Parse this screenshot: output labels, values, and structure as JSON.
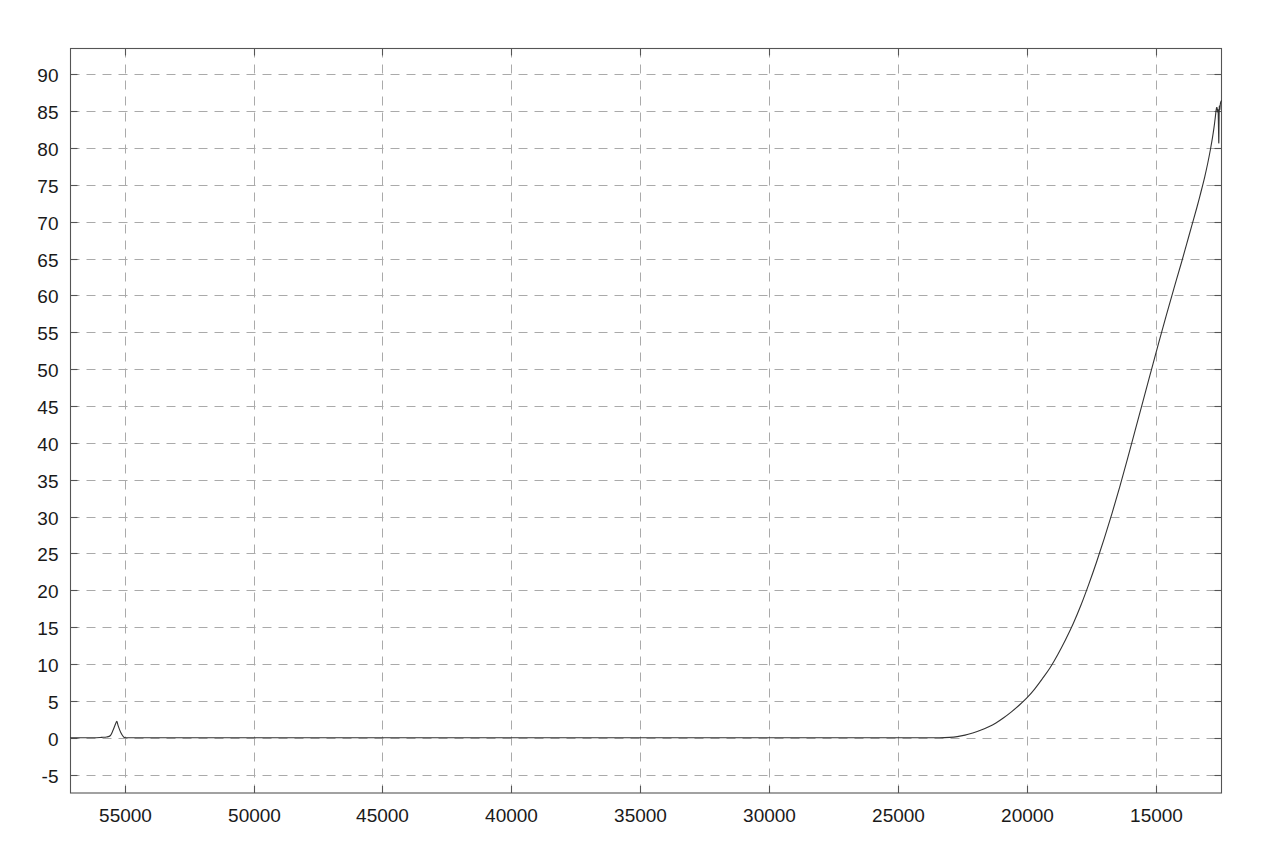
{
  "chart_data": {
    "type": "line",
    "title": "",
    "subtitle": "",
    "xlabel": "",
    "ylabel": "",
    "xlim": [
      57100,
      12450
    ],
    "ylim": [
      -7.5,
      93.5
    ],
    "x_axis_reversed": true,
    "grid": true,
    "grid_style": "dashed",
    "legend": "none",
    "xticks": [
      55000,
      50000,
      45000,
      40000,
      35000,
      30000,
      25000,
      20000,
      15000
    ],
    "xtick_labels": [
      "55000",
      "50000",
      "45000",
      "40000",
      "35000",
      "30000",
      "25000",
      "20000",
      "15000"
    ],
    "yticks": [
      -5,
      0,
      5,
      10,
      15,
      20,
      25,
      30,
      35,
      40,
      45,
      50,
      55,
      60,
      65,
      70,
      75,
      80,
      85,
      90
    ],
    "ytick_labels": [
      "-5",
      "0",
      "5",
      "10",
      "15",
      "20",
      "25",
      "30",
      "35",
      "40",
      "45",
      "50",
      "55",
      "60",
      "65",
      "70",
      "75",
      "80",
      "85",
      "90"
    ],
    "series": [
      {
        "name": "spectrum",
        "color": "#333333",
        "line_width": 1.1,
        "points": [
          [
            57100,
            0.0
          ],
          [
            56600,
            0.0
          ],
          [
            56200,
            0.0
          ],
          [
            55900,
            0.05
          ],
          [
            55700,
            0.1
          ],
          [
            55550,
            0.3
          ],
          [
            55450,
            1.0
          ],
          [
            55350,
            1.9
          ],
          [
            55300,
            2.2
          ],
          [
            55250,
            1.6
          ],
          [
            55150,
            0.7
          ],
          [
            55050,
            0.15
          ],
          [
            54950,
            0.0
          ],
          [
            54500,
            0.0
          ],
          [
            53500,
            0.0
          ],
          [
            52000,
            0.0
          ],
          [
            50000,
            0.0
          ],
          [
            48000,
            0.0
          ],
          [
            46000,
            0.0
          ],
          [
            44000,
            0.0
          ],
          [
            42000,
            0.0
          ],
          [
            40000,
            0.0
          ],
          [
            38000,
            0.0
          ],
          [
            36000,
            0.0
          ],
          [
            34000,
            0.0
          ],
          [
            32000,
            0.0
          ],
          [
            30000,
            0.0
          ],
          [
            28000,
            0.0
          ],
          [
            26000,
            0.0
          ],
          [
            25000,
            0.0
          ],
          [
            24000,
            0.0
          ],
          [
            23400,
            0.0
          ],
          [
            23000,
            0.05
          ],
          [
            22700,
            0.15
          ],
          [
            22400,
            0.35
          ],
          [
            22100,
            0.65
          ],
          [
            21800,
            1.0
          ],
          [
            21500,
            1.45
          ],
          [
            21200,
            2.0
          ],
          [
            20900,
            2.7
          ],
          [
            20600,
            3.5
          ],
          [
            20300,
            4.4
          ],
          [
            20000,
            5.4
          ],
          [
            19700,
            6.6
          ],
          [
            19400,
            8.0
          ],
          [
            19100,
            9.5
          ],
          [
            18800,
            11.3
          ],
          [
            18500,
            13.3
          ],
          [
            18200,
            15.5
          ],
          [
            17900,
            18.0
          ],
          [
            17600,
            20.8
          ],
          [
            17300,
            23.8
          ],
          [
            17000,
            27.0
          ],
          [
            16700,
            30.4
          ],
          [
            16400,
            34.0
          ],
          [
            16100,
            37.8
          ],
          [
            15800,
            41.7
          ],
          [
            15500,
            45.6
          ],
          [
            15200,
            49.5
          ],
          [
            14900,
            53.4
          ],
          [
            14600,
            57.2
          ],
          [
            14300,
            60.9
          ],
          [
            14000,
            64.5
          ],
          [
            13800,
            67.0
          ],
          [
            13600,
            69.5
          ],
          [
            13400,
            72.0
          ],
          [
            13250,
            74.0
          ],
          [
            13100,
            76.1
          ],
          [
            12980,
            78.0
          ],
          [
            12880,
            79.8
          ],
          [
            12800,
            81.4
          ],
          [
            12740,
            82.8
          ],
          [
            12700,
            83.9
          ],
          [
            12670,
            84.8
          ],
          [
            12650,
            85.3
          ],
          [
            12635,
            85.5
          ],
          [
            12620,
            85.4
          ],
          [
            12610,
            85.1
          ],
          [
            12600,
            84.9
          ],
          [
            12592,
            85.0
          ],
          [
            12585,
            85.2
          ],
          [
            12578,
            84.8
          ],
          [
            12570,
            83.4
          ],
          [
            12562,
            81.8
          ],
          [
            12556,
            80.7
          ],
          [
            12552,
            81.2
          ],
          [
            12548,
            82.8
          ],
          [
            12543,
            84.2
          ],
          [
            12538,
            85.2
          ],
          [
            12532,
            85.7
          ],
          [
            12524,
            85.4
          ],
          [
            12516,
            85.2
          ],
          [
            12505,
            85.6
          ],
          [
            12490,
            86.1
          ],
          [
            12470,
            86.3
          ],
          [
            12455,
            86.4
          ],
          [
            12450,
            86.4
          ]
        ]
      }
    ],
    "annotations": [
      {
        "label": "baseline-artifact-peak",
        "x": 55300,
        "y": 2.2
      },
      {
        "label": "absorption-notch-minimum",
        "x": 12556,
        "y": 80.7
      },
      {
        "label": "local-maximum",
        "x": 12635,
        "y": 85.5
      }
    ]
  },
  "colors": {
    "background": "#ffffff",
    "axis": "#555555",
    "grid": "#aaaaaa",
    "curve": "#333333",
    "tick_label": "#1a1a1a"
  }
}
